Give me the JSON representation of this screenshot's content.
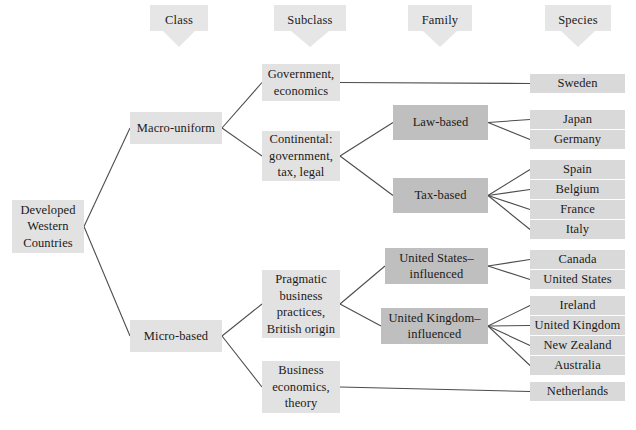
{
  "diagram": {
    "title_bar_headers": [
      {
        "id": "class",
        "label": "Class"
      },
      {
        "id": "subclass",
        "label": "Subclass"
      },
      {
        "id": "family",
        "label": "Family"
      },
      {
        "id": "species",
        "label": "Species"
      }
    ],
    "colors": {
      "background": "#ffffff",
      "node_light": "#e2e2e2",
      "node_dark": "#bfbfbf",
      "node_leaf": "#d9d9d9",
      "header_arrow": "#e6e6e6",
      "connector_line": "#4d4d4d",
      "text": "#1a1a1a"
    },
    "root": {
      "id": "root",
      "label": "Developed\nWestern\nCountries"
    },
    "classes": [
      {
        "id": "macro-uniform",
        "label": "Macro-uniform"
      },
      {
        "id": "micro-based",
        "label": "Micro-based"
      }
    ],
    "subclasses": [
      {
        "id": "government-economics",
        "label": "Government,\neconomics"
      },
      {
        "id": "continental",
        "label": "Continental:\ngovernment,\ntax, legal"
      },
      {
        "id": "pragmatic-business",
        "label": "Pragmatic\nbusiness\npractices,\nBritish origin"
      },
      {
        "id": "business-economics-theory",
        "label": "Business\neconomics,\ntheory"
      }
    ],
    "families": [
      {
        "id": "law-based",
        "label": "Law-based"
      },
      {
        "id": "tax-based",
        "label": "Tax-based"
      },
      {
        "id": "us-influenced",
        "label": "United States–\ninfluenced"
      },
      {
        "id": "uk-influenced",
        "label": "United Kingdom–\ninfluenced"
      }
    ],
    "species": [
      {
        "id": "sweden",
        "label": "Sweden"
      },
      {
        "id": "japan",
        "label": "Japan"
      },
      {
        "id": "germany",
        "label": "Germany"
      },
      {
        "id": "spain",
        "label": "Spain"
      },
      {
        "id": "belgium",
        "label": "Belgium"
      },
      {
        "id": "france",
        "label": "France"
      },
      {
        "id": "italy",
        "label": "Italy"
      },
      {
        "id": "canada",
        "label": "Canada"
      },
      {
        "id": "united-states",
        "label": "United States"
      },
      {
        "id": "ireland",
        "label": "Ireland"
      },
      {
        "id": "united-kingdom",
        "label": "United Kingdom"
      },
      {
        "id": "new-zealand",
        "label": "New Zealand"
      },
      {
        "id": "australia",
        "label": "Australia"
      },
      {
        "id": "netherlands",
        "label": "Netherlands"
      }
    ],
    "edges": [
      {
        "from": "root",
        "to": "macro-uniform"
      },
      {
        "from": "root",
        "to": "micro-based"
      },
      {
        "from": "macro-uniform",
        "to": "government-economics"
      },
      {
        "from": "macro-uniform",
        "to": "continental"
      },
      {
        "from": "micro-based",
        "to": "pragmatic-business"
      },
      {
        "from": "micro-based",
        "to": "business-economics-theory"
      },
      {
        "from": "government-economics",
        "to": "sweden"
      },
      {
        "from": "continental",
        "to": "law-based"
      },
      {
        "from": "continental",
        "to": "tax-based"
      },
      {
        "from": "law-based",
        "to": "japan"
      },
      {
        "from": "law-based",
        "to": "germany"
      },
      {
        "from": "tax-based",
        "to": "spain"
      },
      {
        "from": "tax-based",
        "to": "belgium"
      },
      {
        "from": "tax-based",
        "to": "france"
      },
      {
        "from": "tax-based",
        "to": "italy"
      },
      {
        "from": "pragmatic-business",
        "to": "us-influenced"
      },
      {
        "from": "pragmatic-business",
        "to": "uk-influenced"
      },
      {
        "from": "us-influenced",
        "to": "canada"
      },
      {
        "from": "us-influenced",
        "to": "united-states"
      },
      {
        "from": "uk-influenced",
        "to": "ireland"
      },
      {
        "from": "uk-influenced",
        "to": "united-kingdom"
      },
      {
        "from": "uk-influenced",
        "to": "new-zealand"
      },
      {
        "from": "uk-influenced",
        "to": "australia"
      },
      {
        "from": "business-economics-theory",
        "to": "netherlands"
      }
    ]
  }
}
